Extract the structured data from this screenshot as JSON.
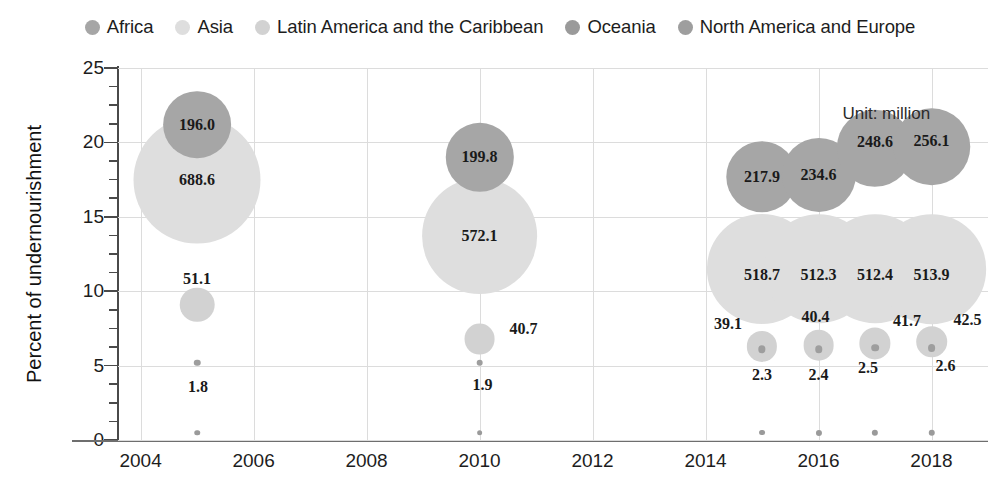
{
  "chart_data": {
    "type": "scatter",
    "title": "",
    "xlabel": "",
    "ylabel": "Percent of undernourishment",
    "annotation": "Unit: million",
    "xlim": [
      2003.6,
      2019.0
    ],
    "ylim": [
      0,
      25
    ],
    "xticks": [
      2004,
      2006,
      2008,
      2010,
      2012,
      2014,
      2016,
      2018
    ],
    "yticks": [
      0,
      5,
      10,
      15,
      20,
      25
    ],
    "grid": true,
    "legend_position": "top",
    "bubble_size_unit": "million people undernourished",
    "series": [
      {
        "name": "Africa",
        "color": "#a6a6a6",
        "points": [
          {
            "x": 2005,
            "y": 21.2,
            "value": 196.0,
            "label": "196.0"
          },
          {
            "x": 2010,
            "y": 19.0,
            "value": 199.8,
            "label": "199.8"
          },
          {
            "x": 2015,
            "y": 17.7,
            "value": 217.9,
            "label": "217.9"
          },
          {
            "x": 2016,
            "y": 17.8,
            "value": 234.6,
            "label": "234.6"
          },
          {
            "x": 2017,
            "y": 19.6,
            "value": 248.6,
            "label": "248.6"
          },
          {
            "x": 2018,
            "y": 19.7,
            "value": 256.1,
            "label": "256.1"
          }
        ]
      },
      {
        "name": "Asia",
        "color": "#dedede",
        "points": [
          {
            "x": 2005,
            "y": 17.5,
            "value": 688.6,
            "label": "688.6"
          },
          {
            "x": 2010,
            "y": 13.7,
            "value": 572.1,
            "label": "572.1"
          },
          {
            "x": 2015,
            "y": 11.5,
            "value": 518.7,
            "label": "518.7"
          },
          {
            "x": 2016,
            "y": 11.5,
            "value": 512.3,
            "label": "512.3"
          },
          {
            "x": 2017,
            "y": 11.5,
            "value": 512.4,
            "label": "512.4"
          },
          {
            "x": 2018,
            "y": 11.5,
            "value": 513.9,
            "label": "513.9"
          }
        ]
      },
      {
        "name": "Latin America and the Caribbean",
        "color": "#d2d2d2",
        "points": [
          {
            "x": 2005,
            "y": 9.1,
            "value": 51.1,
            "label": "51.1"
          },
          {
            "x": 2010,
            "y": 6.8,
            "value": 40.7,
            "label": "40.7"
          },
          {
            "x": 2015,
            "y": 6.3,
            "value": 39.1,
            "label": "39.1"
          },
          {
            "x": 2016,
            "y": 6.4,
            "value": 40.4,
            "label": "40.4"
          },
          {
            "x": 2017,
            "y": 6.5,
            "value": 41.7,
            "label": "41.7"
          },
          {
            "x": 2018,
            "y": 6.6,
            "value": 42.5,
            "label": "42.5"
          }
        ]
      },
      {
        "name": "Oceania",
        "color": "#9a9a9a",
        "points": [
          {
            "x": 2005,
            "y": 0.5,
            "value": 1.3,
            "label": ""
          },
          {
            "x": 2010,
            "y": 0.5,
            "value": 1.4,
            "label": ""
          },
          {
            "x": 2015,
            "y": 0.5,
            "value": 1.5,
            "label": ""
          },
          {
            "x": 2016,
            "y": 0.5,
            "value": 1.6,
            "label": ""
          },
          {
            "x": 2017,
            "y": 0.5,
            "value": 1.7,
            "label": ""
          },
          {
            "x": 2018,
            "y": 0.5,
            "value": 1.8,
            "label": ""
          }
        ]
      },
      {
        "name": "North America and Europe",
        "color": "#9e9e9e",
        "points": [
          {
            "x": 2005,
            "y": 5.2,
            "value": 1.8,
            "label": "1.8"
          },
          {
            "x": 2010,
            "y": 5.2,
            "value": 1.9,
            "label": "1.9"
          },
          {
            "x": 2015,
            "y": 6.1,
            "value": 2.3,
            "label": "2.3"
          },
          {
            "x": 2016,
            "y": 6.1,
            "value": 2.4,
            "label": "2.4"
          },
          {
            "x": 2017,
            "y": 6.2,
            "value": 2.5,
            "label": "2.5"
          },
          {
            "x": 2018,
            "y": 6.2,
            "value": 2.6,
            "label": "2.6"
          }
        ]
      }
    ]
  },
  "legend": {
    "items": [
      {
        "label": "Africa",
        "color": "#a6a6a6"
      },
      {
        "label": "Asia",
        "color": "#dedede"
      },
      {
        "label": "Latin America and the Caribbean",
        "color": "#d2d2d2"
      },
      {
        "label": "Oceania",
        "color": "#9a9a9a"
      },
      {
        "label": "North America and Europe",
        "color": "#9e9e9e"
      }
    ]
  },
  "axes": {
    "y_title": "Percent of undernourishment",
    "y_tick_labels": [
      "25",
      "20",
      "15",
      "10",
      "5",
      "0"
    ],
    "x_tick_labels": [
      "2004",
      "2006",
      "2008",
      "2010",
      "2012",
      "2014",
      "2016",
      "2018"
    ]
  },
  "annotations": {
    "unit": "Unit: million"
  },
  "bubble_labels": {
    "africa_2005": "196.0",
    "africa_2010": "199.8",
    "africa_2015": "217.9",
    "africa_2016": "234.6",
    "africa_2017": "248.6",
    "africa_2018": "256.1",
    "asia_2005": "688.6",
    "asia_2010": "572.1",
    "asia_2015": "518.7",
    "asia_2016": "512.3",
    "asia_2017": "512.4",
    "asia_2018": "513.9",
    "latam_2005": "51.1",
    "latam_2010": "40.7",
    "latam_2015": "39.1",
    "latam_2016": "40.4",
    "latam_2017": "41.7",
    "latam_2018": "42.5",
    "name_2005": "1.8",
    "name_2010": "1.9",
    "name_2015": "2.3",
    "name_2016": "2.4",
    "name_2017": "2.5",
    "name_2018": "2.6"
  }
}
